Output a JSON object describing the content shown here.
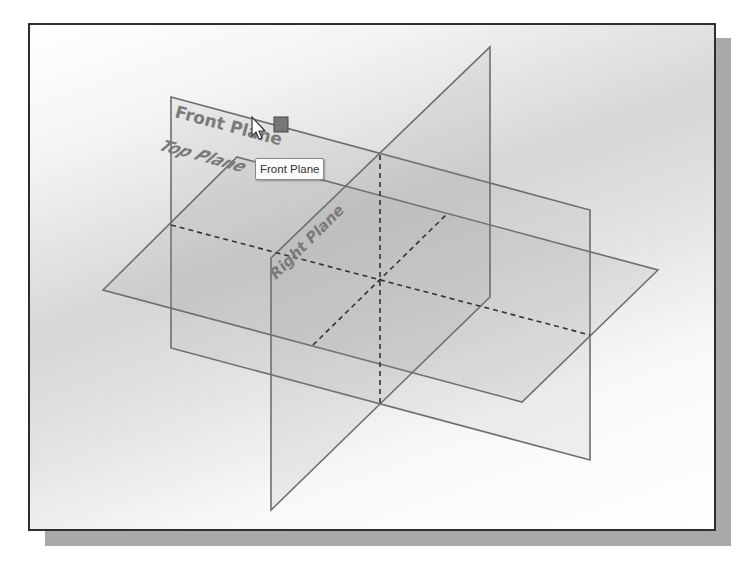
{
  "viewport": {
    "background": "gradient-gray",
    "frame_color": "#2e2e2e"
  },
  "planes": [
    {
      "name": "Front Plane",
      "label": "Front Plane"
    },
    {
      "name": "Top Plane",
      "label": "Top Plane"
    },
    {
      "name": "Right Plane",
      "label": "Right Plane"
    }
  ],
  "tooltip": {
    "text": "Front Plane"
  },
  "cursor": {
    "icon": "select-arrow-icon",
    "badge_icon": "plane-select-icon"
  },
  "colors": {
    "plane_edge": "#6e6e6e",
    "plane_fill": "#9a9a9a",
    "label": "#6a6a6a"
  }
}
